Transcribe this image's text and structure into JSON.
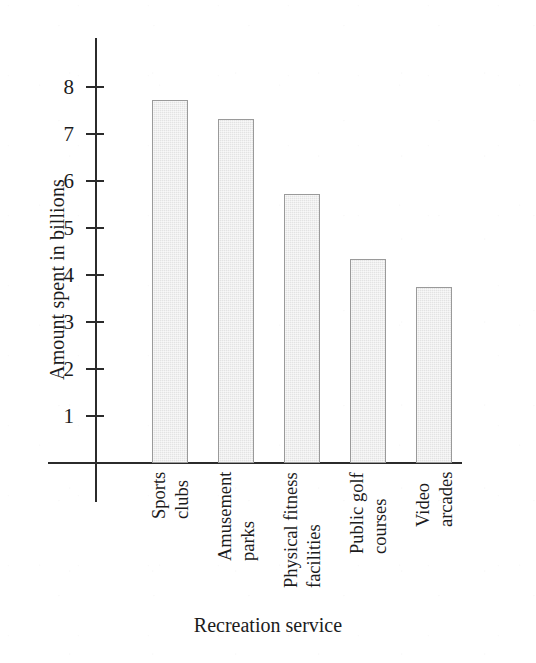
{
  "chart_data": {
    "type": "bar",
    "title": "",
    "xlabel": "Recreation service",
    "ylabel": "Amount spent in billions",
    "categories": [
      "Sports clubs",
      "Amusement parks",
      "Physical fitness facilities",
      "Public golf courses",
      "Video arcades"
    ],
    "category_lines": [
      [
        "Sports",
        "clubs"
      ],
      [
        "Amusement",
        "parks"
      ],
      [
        "Physical fitness",
        "facilities"
      ],
      [
        "Public golf",
        "courses"
      ],
      [
        "Video",
        "arcades"
      ]
    ],
    "values": [
      7.72,
      7.32,
      5.72,
      4.33,
      3.75
    ],
    "ylim": [
      0,
      8.6
    ],
    "yticks": [
      1,
      2,
      3,
      4,
      5,
      6,
      7,
      8
    ],
    "ytick_labels": [
      "1",
      "2",
      "3",
      "4",
      "5",
      "6",
      "7",
      "8"
    ],
    "grid": false,
    "legend": false,
    "bar_fill_color": "#e3e3e3",
    "bar_border_color": "#9a9a9a",
    "axis_color": "#2b2b2b"
  }
}
